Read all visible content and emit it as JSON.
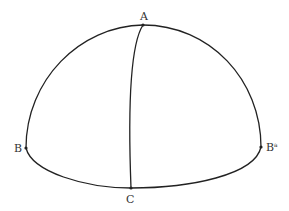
{
  "diagram": {
    "type": "spherical-hemisphere",
    "stroke_color": "#222222",
    "points": {
      "A": {
        "label": "A",
        "x": 143,
        "y": 25
      },
      "B": {
        "label": "B",
        "x": 26,
        "y": 148
      },
      "B2": {
        "label": "B",
        "sup": "a",
        "x": 261,
        "y": 147
      },
      "C": {
        "label": "C",
        "x": 131,
        "y": 188
      }
    },
    "curves": [
      {
        "name": "outer-arc",
        "from": "B",
        "through": "A",
        "to": "B2"
      },
      {
        "name": "base-arc",
        "from": "B",
        "through": "C",
        "to": "B2"
      },
      {
        "name": "meridian",
        "from": "A",
        "to": "C"
      }
    ]
  }
}
